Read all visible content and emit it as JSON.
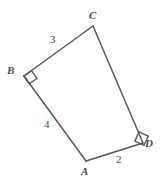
{
  "figure": {
    "background_color": "#ffffff",
    "stroke_color": "#55555a",
    "label_color": "#4a4a50",
    "vertices": [
      {
        "name": "A",
        "label": "A",
        "x": 86,
        "y": 161
      },
      {
        "name": "B",
        "label": "B",
        "x": 24,
        "y": 76
      },
      {
        "name": "C",
        "label": "C",
        "x": 93,
        "y": 26
      },
      {
        "name": "D",
        "label": "D",
        "x": 143,
        "y": 143
      }
    ],
    "edges": [
      {
        "name": "edge-BC",
        "from": "B",
        "to": "C",
        "length_label": "3"
      },
      {
        "name": "edge-CD",
        "from": "C",
        "to": "D",
        "length_label": ""
      },
      {
        "name": "edge-DA",
        "from": "D",
        "to": "A",
        "length_label": "2"
      },
      {
        "name": "edge-AB",
        "from": "A",
        "to": "B",
        "length_label": "4"
      }
    ],
    "right_angles": [
      {
        "at": "B"
      },
      {
        "at": "D"
      }
    ],
    "labels": {
      "A": "A",
      "B": "B",
      "C": "C",
      "D": "D"
    },
    "lengths": {
      "AB": "4",
      "BC": "3",
      "AD": "2"
    }
  }
}
